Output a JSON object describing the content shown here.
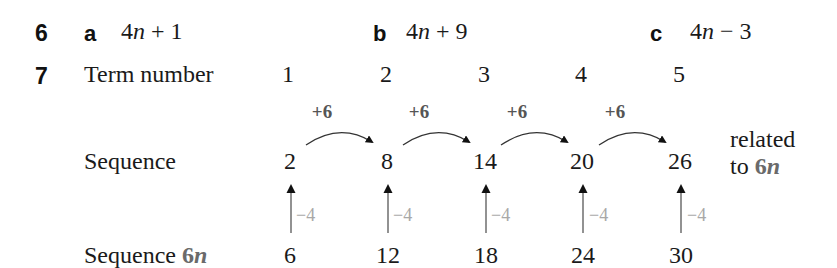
{
  "question6": {
    "number": "6",
    "parts": [
      {
        "letter": "a",
        "coef": "4",
        "var": "n",
        "rest": " + 1"
      },
      {
        "letter": "b",
        "coef": "4",
        "var": "n",
        "rest": " + 9"
      },
      {
        "letter": "c",
        "coef": "4",
        "var": "n",
        "rest": " − 3"
      }
    ]
  },
  "question7": {
    "number": "7",
    "term_label": "Term number",
    "terms": [
      "1",
      "2",
      "3",
      "4",
      "5"
    ],
    "sequence_label": "Sequence",
    "sequence": [
      "2",
      "8",
      "14",
      "20",
      "26"
    ],
    "differences": [
      "+6",
      "+6",
      "+6",
      "+6"
    ],
    "adjustments": [
      "−4",
      "−4",
      "−4",
      "−4",
      "−4"
    ],
    "sequence6n_label_prefix": "Sequence ",
    "sequence6n_label_coef": "6",
    "sequence6n_label_var": "n",
    "sequence6n": [
      "6",
      "12",
      "18",
      "24",
      "30"
    ],
    "note_line1": "related",
    "note_line2_prefix": "to ",
    "note_coef": "6",
    "note_var": "n"
  },
  "colors": {
    "text": "#1a1a1a",
    "difference_label": "#555555",
    "adjustment_label": "#a8a8a8",
    "arrow_line": "#777777",
    "highlight_6n": "#6a6a6a"
  }
}
